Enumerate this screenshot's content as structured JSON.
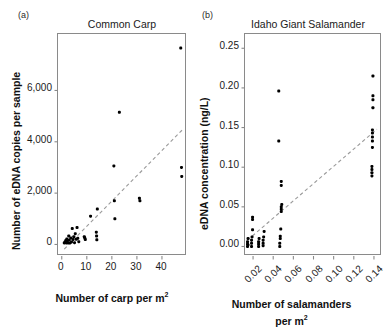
{
  "figure": {
    "width": 388,
    "height": 334,
    "background": "#ffffff",
    "point_color": "#000000",
    "trendline_color": "#9a9a9a",
    "frame_color": "#8a8a8a"
  },
  "panels": [
    {
      "letter": "(a)",
      "title": "Common Carp",
      "r2_prefix": "r",
      "r2_sup": "2",
      "r2_value": "= 0.70",
      "r2_text": "r2 = 0.70",
      "chart_data": {
        "type": "scatter",
        "title": "Common Carp",
        "xlabel": "Number of carp per m2",
        "ylabel": "Number of eDNA copies per sample",
        "xlim": [
          -1.5,
          50
        ],
        "ylim": [
          -450,
          8200
        ],
        "xticks": [
          0,
          10,
          20,
          30,
          40
        ],
        "xtick_labels": [
          "0",
          "10",
          "20",
          "30",
          "40"
        ],
        "yticks": [
          0,
          2000,
          4000,
          6000
        ],
        "ytick_labels": [
          "0",
          "2,000",
          "4,000",
          "6,000"
        ],
        "grid": false,
        "legend": "none",
        "annotation": "r2 = 0.70",
        "r_squared": 0.7,
        "trendline": {
          "style": "dashed",
          "x": [
            1.0,
            48.0
          ],
          "y": [
            -180,
            4450
          ]
        },
        "points": [
          {
            "x": 1.0,
            "y": 60
          },
          {
            "x": 1.3,
            "y": 100
          },
          {
            "x": 1.6,
            "y": 150
          },
          {
            "x": 1.8,
            "y": 60
          },
          {
            "x": 2.0,
            "y": 210
          },
          {
            "x": 2.2,
            "y": 120
          },
          {
            "x": 2.5,
            "y": 60
          },
          {
            "x": 2.8,
            "y": 330
          },
          {
            "x": 3.0,
            "y": 170
          },
          {
            "x": 3.3,
            "y": 60
          },
          {
            "x": 3.6,
            "y": 250
          },
          {
            "x": 3.9,
            "y": 100
          },
          {
            "x": 4.2,
            "y": 620
          },
          {
            "x": 4.5,
            "y": 190
          },
          {
            "x": 4.8,
            "y": 300
          },
          {
            "x": 5.1,
            "y": 70
          },
          {
            "x": 5.4,
            "y": 420
          },
          {
            "x": 5.8,
            "y": 200
          },
          {
            "x": 6.1,
            "y": 660
          },
          {
            "x": 6.4,
            "y": 240
          },
          {
            "x": 6.8,
            "y": 110
          },
          {
            "x": 9.0,
            "y": 300
          },
          {
            "x": 9.2,
            "y": 250
          },
          {
            "x": 9.4,
            "y": 190
          },
          {
            "x": 11.5,
            "y": 1100
          },
          {
            "x": 13.8,
            "y": 480
          },
          {
            "x": 13.9,
            "y": 330
          },
          {
            "x": 14.0,
            "y": 180
          },
          {
            "x": 14.2,
            "y": 1380
          },
          {
            "x": 20.8,
            "y": 3060
          },
          {
            "x": 21.0,
            "y": 1700
          },
          {
            "x": 21.2,
            "y": 1000
          },
          {
            "x": 23.0,
            "y": 5150
          },
          {
            "x": 31.0,
            "y": 1800
          },
          {
            "x": 31.2,
            "y": 1700
          },
          {
            "x": 47.5,
            "y": 7650
          },
          {
            "x": 47.8,
            "y": 3000
          },
          {
            "x": 47.9,
            "y": 2650
          }
        ]
      }
    },
    {
      "letter": "(b)",
      "title": "Idaho Giant Salamander",
      "r2_prefix": "r",
      "r2_sup": "2",
      "r2_value": "= 0.63",
      "r2_text": "r2 = 0.63",
      "chart_data": {
        "type": "scatter",
        "title": "Idaho Giant Salamander",
        "xlabel": "Number of salamanders per m2",
        "ylabel": "eDNA concentration (ng/L)",
        "xlim": [
          0.012,
          0.148
        ],
        "ylim": [
          -0.012,
          0.268
        ],
        "xticks": [
          0.02,
          0.04,
          0.06,
          0.08,
          0.1,
          0.12,
          0.14
        ],
        "xtick_labels": [
          "0.02",
          "0.04",
          "0.06",
          "0.08",
          "0.10",
          "0.12",
          "0.14"
        ],
        "yticks": [
          0.0,
          0.05,
          0.1,
          0.15,
          0.2,
          0.25
        ],
        "ytick_labels": [
          "0.00",
          "0.05",
          "0.10",
          "0.15",
          "0.20",
          "0.25"
        ],
        "grid": false,
        "legend": "none",
        "annotation": "r2 = 0.63",
        "r_squared": 0.63,
        "trendline": {
          "style": "dashed",
          "x": [
            0.0145,
            0.143
          ],
          "y": [
            0.008,
            0.148
          ]
        },
        "points": [
          {
            "x": 0.0145,
            "y": 0.0
          },
          {
            "x": 0.0145,
            "y": 0.003
          },
          {
            "x": 0.0145,
            "y": 0.006
          },
          {
            "x": 0.015,
            "y": 0.01
          },
          {
            "x": 0.015,
            "y": 0.002
          },
          {
            "x": 0.0185,
            "y": 0.0
          },
          {
            "x": 0.0185,
            "y": 0.004
          },
          {
            "x": 0.0185,
            "y": 0.008
          },
          {
            "x": 0.019,
            "y": 0.012
          },
          {
            "x": 0.0195,
            "y": 0.021
          },
          {
            "x": 0.0195,
            "y": 0.034
          },
          {
            "x": 0.0195,
            "y": 0.037
          },
          {
            "x": 0.0255,
            "y": 0.0
          },
          {
            "x": 0.0255,
            "y": 0.003
          },
          {
            "x": 0.0255,
            "y": 0.006
          },
          {
            "x": 0.026,
            "y": 0.01
          },
          {
            "x": 0.03,
            "y": 0.001
          },
          {
            "x": 0.03,
            "y": 0.004
          },
          {
            "x": 0.03,
            "y": 0.008
          },
          {
            "x": 0.0305,
            "y": 0.012
          },
          {
            "x": 0.031,
            "y": 0.019
          },
          {
            "x": 0.0465,
            "y": 0.0
          },
          {
            "x": 0.0465,
            "y": 0.004
          },
          {
            "x": 0.047,
            "y": 0.01
          },
          {
            "x": 0.047,
            "y": 0.013
          },
          {
            "x": 0.0475,
            "y": 0.022
          },
          {
            "x": 0.048,
            "y": 0.044
          },
          {
            "x": 0.048,
            "y": 0.047
          },
          {
            "x": 0.048,
            "y": 0.05
          },
          {
            "x": 0.0485,
            "y": 0.053
          },
          {
            "x": 0.048,
            "y": 0.077
          },
          {
            "x": 0.048,
            "y": 0.082
          },
          {
            "x": 0.0455,
            "y": 0.133
          },
          {
            "x": 0.0455,
            "y": 0.196
          },
          {
            "x": 0.138,
            "y": 0.089
          },
          {
            "x": 0.138,
            "y": 0.093
          },
          {
            "x": 0.138,
            "y": 0.097
          },
          {
            "x": 0.138,
            "y": 0.101
          },
          {
            "x": 0.1385,
            "y": 0.125
          },
          {
            "x": 0.1385,
            "y": 0.133
          },
          {
            "x": 0.1385,
            "y": 0.138
          },
          {
            "x": 0.1385,
            "y": 0.143
          },
          {
            "x": 0.1385,
            "y": 0.147
          },
          {
            "x": 0.139,
            "y": 0.175
          },
          {
            "x": 0.139,
            "y": 0.185
          },
          {
            "x": 0.139,
            "y": 0.19
          },
          {
            "x": 0.139,
            "y": 0.215
          }
        ]
      }
    }
  ]
}
